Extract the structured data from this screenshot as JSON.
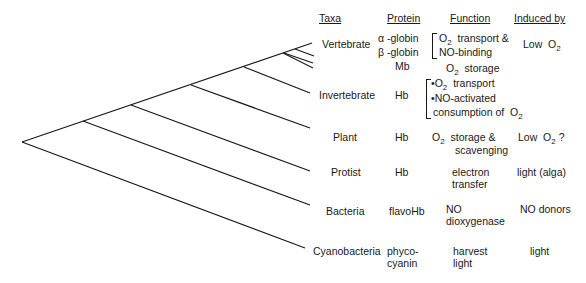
{
  "headers": {
    "taxa": "Taxa",
    "protein": "Protein",
    "function": "Function",
    "induced_by": "Induced by"
  },
  "rows": [
    {
      "taxa": "Vertebrate",
      "protein": [
        "α -globin",
        "β -globin",
        "Mb"
      ],
      "function": [
        "O2 transport &",
        "NO-binding",
        "O2 storage"
      ],
      "induced_by": "Low O2"
    },
    {
      "taxa": "Invertebrate",
      "protein": [
        "Hb"
      ],
      "function": [
        "•O2 transport",
        "•NO-activated",
        "consumption of O2"
      ],
      "induced_by": ""
    },
    {
      "taxa": "Plant",
      "protein": [
        "Hb"
      ],
      "function": [
        "O2 storage &",
        "scavenging"
      ],
      "induced_by": "Low O2 ?"
    },
    {
      "taxa": "Protist",
      "protein": [
        "Hb"
      ],
      "function": [
        "electron",
        "transfer"
      ],
      "induced_by": "light (alga)"
    },
    {
      "taxa": "Bacteria",
      "protein": [
        "flavoHb"
      ],
      "function": [
        "NO",
        "dioxygenase"
      ],
      "induced_by": "NO donors"
    },
    {
      "taxa": "Cyanobacteria",
      "protein": [
        "phyco-",
        "cyanin"
      ],
      "function": [
        "harvest",
        "light"
      ],
      "induced_by": "light"
    }
  ],
  "colors": {
    "line": "#1a1a1a",
    "text": "#1a1a1a",
    "background": "#ffffff"
  }
}
